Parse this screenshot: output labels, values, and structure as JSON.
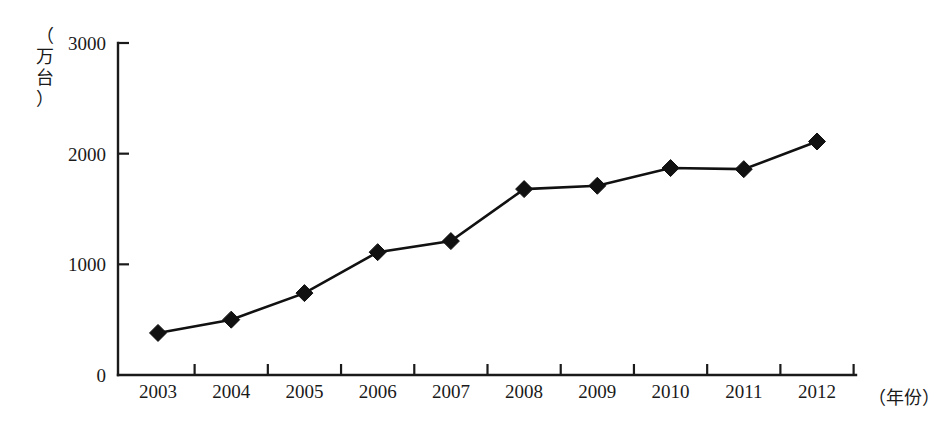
{
  "chart_data": {
    "type": "line",
    "title": "",
    "subtitle": "",
    "xlabel": "（年份）",
    "ylabel": "（万台）",
    "ylabel_chars": [
      "（",
      "万",
      "台",
      "）"
    ],
    "categories": [
      "2003",
      "2004",
      "2005",
      "2006",
      "2007",
      "2008",
      "2009",
      "2010",
      "2011",
      "2012"
    ],
    "values": [
      380,
      500,
      740,
      1110,
      1210,
      1680,
      1710,
      1870,
      1860,
      2110
    ],
    "series": [
      {
        "name": "",
        "values": [
          380,
          500,
          740,
          1110,
          1210,
          1680,
          1710,
          1870,
          1860,
          2110
        ]
      }
    ],
    "ylim": [
      0,
      3000
    ],
    "yticks": [
      0,
      1000,
      2000,
      3000
    ],
    "ytick_labels": [
      "0",
      "1000",
      "2000",
      "3000"
    ],
    "xtick_labels": [
      "2003",
      "2004",
      "2005",
      "2006",
      "2007",
      "2008",
      "2009",
      "2010",
      "2011",
      "2012"
    ],
    "grid": false,
    "legend": false,
    "legend_position": "none",
    "marker": "diamond",
    "line_color": "#111111",
    "marker_color": "#111111",
    "axis_color": "#1a1a1a",
    "background_color": "#ffffff",
    "annotations": []
  }
}
